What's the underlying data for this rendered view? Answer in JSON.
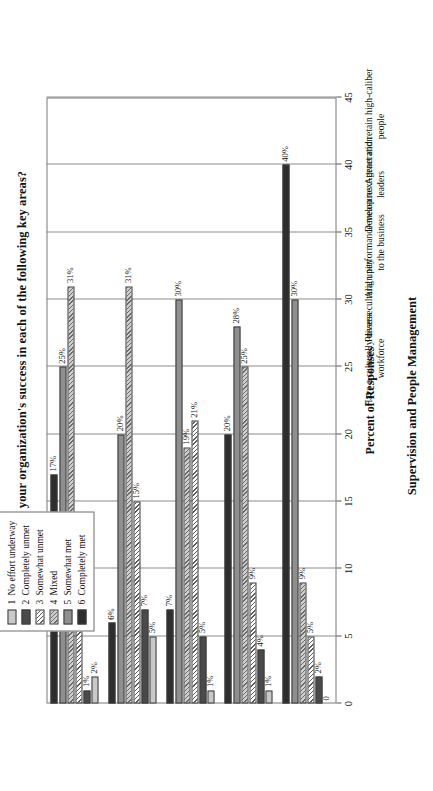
{
  "chart_data": {
    "type": "bar",
    "title": "How would you rate your organization's success in each of the following key areas?",
    "xlabel": "Supervision and People Management",
    "ylabel": "Percent of Responses",
    "ylim": [
      0,
      45
    ],
    "yticks": [
      0,
      5,
      10,
      15,
      20,
      25,
      30,
      35,
      40,
      45
    ],
    "ytick_labels": [
      "0",
      "5",
      "10",
      "15",
      "20",
      "25",
      "30",
      "35",
      "40",
      "45"
    ],
    "grid": true,
    "legend_position": "top-center",
    "orientation": "horizontal-bars",
    "categories": [
      "Attract and retain high-caliber people",
      "Develop next-generation leaders",
      "Align performance measures to the business",
      "Possess cultural unity",
      "Have a culturally diverse workforce"
    ],
    "series": [
      {
        "name": "1  No effort underway",
        "key": "s1",
        "values": [
          0,
          1,
          1,
          5,
          2
        ],
        "labels": [
          "0",
          "1%",
          "1%",
          "5%",
          "2%"
        ]
      },
      {
        "name": "2  Completely unmet",
        "key": "s2",
        "values": [
          2,
          4,
          5,
          7,
          1
        ],
        "labels": [
          "2%",
          "4%",
          "5%",
          "7%",
          "1%"
        ]
      },
      {
        "name": "3  Somewhat unmet",
        "key": "s3",
        "values": [
          5,
          9,
          21,
          15,
          9
        ],
        "labels": [
          "5%",
          "9%",
          "21%",
          "15%",
          "9%"
        ]
      },
      {
        "name": "4  Mixed",
        "key": "s4",
        "values": [
          9,
          25,
          19,
          31,
          31
        ],
        "labels": [
          "9%",
          "25%",
          "19%",
          "31%",
          "31%"
        ]
      },
      {
        "name": "5  Somewhat met",
        "key": "s5",
        "values": [
          30,
          28,
          30,
          20,
          25
        ],
        "labels": [
          "30%",
          "28%",
          "30%",
          "20%",
          "25%"
        ]
      },
      {
        "name": "6  Completely met",
        "key": "s6",
        "values": [
          40,
          20,
          7,
          6,
          17
        ],
        "labels": [
          "40%",
          "20%",
          "7%",
          "6%",
          "17%"
        ]
      }
    ]
  },
  "legend": {
    "entries": [
      {
        "num": "1",
        "label": "No effort underway",
        "swatch": "s1"
      },
      {
        "num": "2",
        "label": "Completely unmet",
        "swatch": "s2"
      },
      {
        "num": "3",
        "label": "Somewhat unmet",
        "swatch": "s3"
      },
      {
        "num": "4",
        "label": "Mixed",
        "swatch": "s4"
      },
      {
        "num": "5",
        "label": "Somewhat met",
        "swatch": "s5"
      },
      {
        "num": "6",
        "label": "Completely met",
        "swatch": "s6"
      }
    ]
  }
}
